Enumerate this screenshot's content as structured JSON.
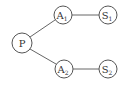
{
  "diagram": {
    "type": "tree",
    "nodes": [
      {
        "id": "P",
        "label": "P",
        "sub": "",
        "cx": 22,
        "cy": 43
      },
      {
        "id": "A1",
        "label": "A",
        "sub": "1",
        "cx": 63,
        "cy": 15
      },
      {
        "id": "S1",
        "label": "S",
        "sub": "1",
        "cx": 108,
        "cy": 15
      },
      {
        "id": "A2",
        "label": "A",
        "sub": "2",
        "cx": 64,
        "cy": 69
      },
      {
        "id": "S2",
        "label": "S",
        "sub": "2",
        "cx": 108,
        "cy": 69
      }
    ],
    "edges": [
      {
        "from": "P",
        "to": "A1"
      },
      {
        "from": "P",
        "to": "A2"
      },
      {
        "from": "A1",
        "to": "S1"
      },
      {
        "from": "A2",
        "to": "S2"
      }
    ],
    "colors": {
      "stroke": "#555555",
      "text": "#333333",
      "background": "#ffffff"
    }
  }
}
